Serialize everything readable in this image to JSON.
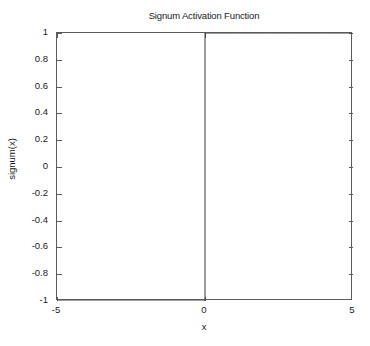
{
  "chart_data": {
    "type": "line",
    "title": "Signum Activation Function",
    "xlabel": "x",
    "ylabel": "signum(x)",
    "xlim": [
      -5,
      5
    ],
    "ylim": [
      -1,
      1
    ],
    "grid": false,
    "legend": null,
    "xticks": [
      -5,
      0,
      5
    ],
    "xticklabels": [
      "-5",
      "0",
      "5"
    ],
    "yticks": [
      1,
      0.8,
      0.6,
      0.4,
      0.2,
      0,
      -0.2,
      -0.4,
      -0.6,
      -0.8,
      -1
    ],
    "yticklabels": [
      "1",
      "0.8",
      "0.6",
      "0.4",
      "0.2",
      "0",
      "-0.2",
      "-0.4",
      "-0.6",
      "-0.8",
      "-1"
    ],
    "line_color": "#3a3a3a",
    "series": [
      {
        "name": "signum(x)",
        "x": [
          -5,
          -4,
          -3,
          -2,
          -1,
          -0.0001,
          0,
          0.0001,
          1,
          2,
          3,
          4,
          5
        ],
        "values": [
          -1,
          -1,
          -1,
          -1,
          -1,
          -1,
          0,
          1,
          1,
          1,
          1,
          1,
          1
        ]
      }
    ]
  },
  "axes": {
    "border_color": "#5a5a5a",
    "background": "#ffffff"
  },
  "labels": {
    "y": [
      {
        "text": "1",
        "value": 1
      },
      {
        "text": "0.8",
        "value": 0.8
      },
      {
        "text": "0.6",
        "value": 0.6
      },
      {
        "text": "0.4",
        "value": 0.4
      },
      {
        "text": "0.2",
        "value": 0.2
      },
      {
        "text": "0",
        "value": 0
      },
      {
        "text": "-0.2",
        "value": -0.2
      },
      {
        "text": "-0.4",
        "value": -0.4
      },
      {
        "text": "-0.6",
        "value": -0.6
      },
      {
        "text": "-0.8",
        "value": -0.8
      },
      {
        "text": "-1",
        "value": -1
      }
    ],
    "x": [
      {
        "text": "-5",
        "value": -5
      },
      {
        "text": "0",
        "value": 0
      },
      {
        "text": "5",
        "value": 5
      }
    ]
  }
}
